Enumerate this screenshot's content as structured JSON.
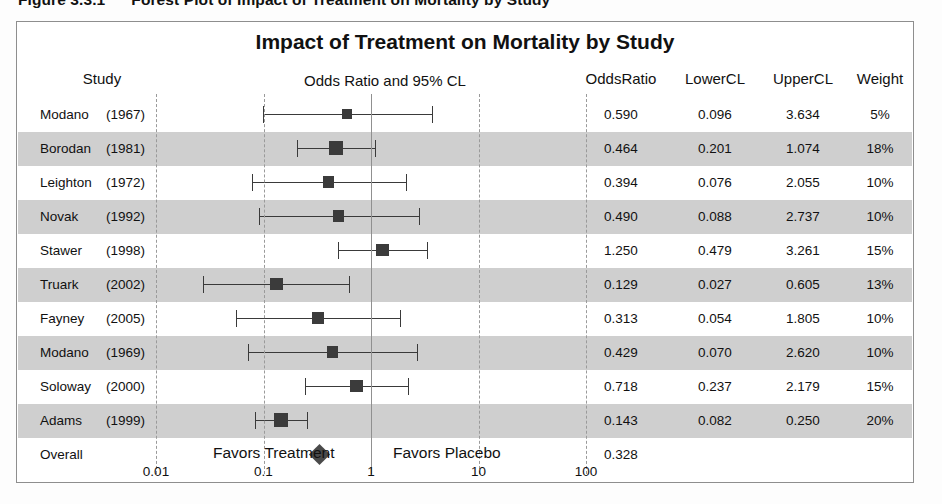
{
  "caption": {
    "number": "Figure 3.3.1",
    "text": "Forest Plot of Impact of Treatment on Mortality by Study"
  },
  "plot": {
    "title": "Impact of Treatment on Mortality by Study",
    "headers": {
      "study": "Study",
      "plot": "Odds Ratio and 95% CL",
      "odds_ratio": "OddsRatio",
      "lower_cl": "LowerCL",
      "upper_cl": "UpperCL",
      "weight": "Weight"
    },
    "axis": {
      "favors_left": "Favors Treatment",
      "favors_right": "Favors Placebo",
      "ticks": [
        "0.01",
        "0.1",
        "1",
        "10",
        "100"
      ]
    },
    "overall_label": "Overall",
    "colors": {
      "band": "#cfcfcf",
      "marker": "#3b3b3b",
      "reference_line": "#909090",
      "gridline": "#9a9a9a",
      "frame": "#8e8e8e"
    }
  },
  "chart_data": {
    "type": "forest",
    "title": "Impact of Treatment on Mortality by Study",
    "xlabel": "Odds Ratio and 95% CL",
    "ylabel": "Study",
    "xscale": "log",
    "xlim": [
      0.01,
      100
    ],
    "xticks": [
      0.01,
      0.1,
      1,
      10,
      100
    ],
    "reference_line": 1,
    "grid": true,
    "columns": [
      "Study",
      "OddsRatio",
      "LowerCL",
      "UpperCL",
      "Weight"
    ],
    "rows": [
      {
        "study": "Modano",
        "year": "(1967)",
        "odds_ratio": "0.590",
        "lower_cl": "0.096",
        "upper_cl": "3.634",
        "weight": "5%",
        "or": 0.59,
        "lcl": 0.096,
        "ucl": 3.634,
        "w": 5
      },
      {
        "study": "Borodan",
        "year": "(1981)",
        "odds_ratio": "0.464",
        "lower_cl": "0.201",
        "upper_cl": "1.074",
        "weight": "18%",
        "or": 0.464,
        "lcl": 0.201,
        "ucl": 1.074,
        "w": 18
      },
      {
        "study": "Leighton",
        "year": "(1972)",
        "odds_ratio": "0.394",
        "lower_cl": "0.076",
        "upper_cl": "2.055",
        "weight": "10%",
        "or": 0.394,
        "lcl": 0.076,
        "ucl": 2.055,
        "w": 10
      },
      {
        "study": "Novak",
        "year": "(1992)",
        "odds_ratio": "0.490",
        "lower_cl": "0.088",
        "upper_cl": "2.737",
        "weight": "10%",
        "or": 0.49,
        "lcl": 0.088,
        "ucl": 2.737,
        "w": 10
      },
      {
        "study": "Stawer",
        "year": "(1998)",
        "odds_ratio": "1.250",
        "lower_cl": "0.479",
        "upper_cl": "3.261",
        "weight": "15%",
        "or": 1.25,
        "lcl": 0.479,
        "ucl": 3.261,
        "w": 15
      },
      {
        "study": "Truark",
        "year": "(2002)",
        "odds_ratio": "0.129",
        "lower_cl": "0.027",
        "upper_cl": "0.605",
        "weight": "13%",
        "or": 0.129,
        "lcl": 0.027,
        "ucl": 0.605,
        "w": 13
      },
      {
        "study": "Fayney",
        "year": "(2005)",
        "odds_ratio": "0.313",
        "lower_cl": "0.054",
        "upper_cl": "1.805",
        "weight": "10%",
        "or": 0.313,
        "lcl": 0.054,
        "ucl": 1.805,
        "w": 10
      },
      {
        "study": "Modano",
        "year": "(1969)",
        "odds_ratio": "0.429",
        "lower_cl": "0.070",
        "upper_cl": "2.620",
        "weight": "10%",
        "or": 0.429,
        "lcl": 0.07,
        "ucl": 2.62,
        "w": 10
      },
      {
        "study": "Soloway",
        "year": "(2000)",
        "odds_ratio": "0.718",
        "lower_cl": "0.237",
        "upper_cl": "2.179",
        "weight": "15%",
        "or": 0.718,
        "lcl": 0.237,
        "ucl": 2.179,
        "w": 15
      },
      {
        "study": "Adams",
        "year": "(1999)",
        "odds_ratio": "0.143",
        "lower_cl": "0.082",
        "upper_cl": "0.250",
        "weight": "20%",
        "or": 0.143,
        "lcl": 0.082,
        "ucl": 0.25,
        "w": 20
      }
    ],
    "overall": {
      "study": "Overall",
      "year": "",
      "odds_ratio": "0.328",
      "lower_cl": "",
      "upper_cl": "",
      "weight": "",
      "or": 0.328
    }
  }
}
